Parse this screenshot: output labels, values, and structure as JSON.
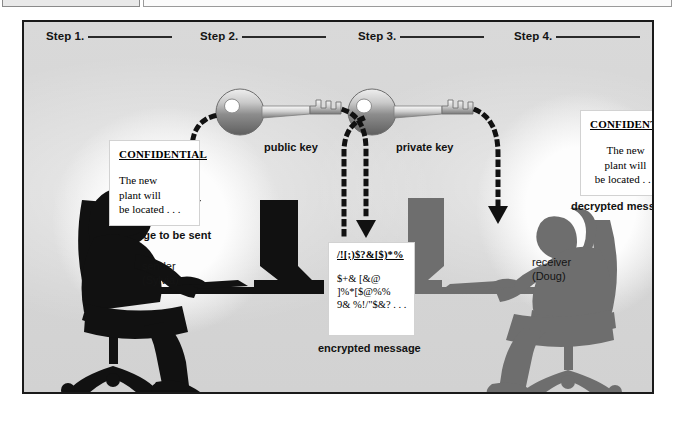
{
  "figure": {
    "background_color": "#d7d7d7",
    "border_color": "#1a1a1a"
  },
  "steps": [
    {
      "label": "Step 1.",
      "answer": ""
    },
    {
      "label": "Step 2.",
      "answer": ""
    },
    {
      "label": "Step 3.",
      "answer": ""
    },
    {
      "label": "Step 4.",
      "answer": ""
    }
  ],
  "messages": {
    "sender_card": {
      "heading": "CONFIDENTIAL",
      "lines": [
        "The new",
        "plant will",
        "be located . . ."
      ],
      "caption": "message to be sent"
    },
    "encrypted_card": {
      "heading": "/![;)$?&[$)*%",
      "lines": [
        "$+& [&@",
        "]%*[$@%%",
        "9& %!/\"$&? . . ."
      ],
      "caption": "encrypted message"
    },
    "receiver_card": {
      "heading": "CONFIDENTIAL",
      "lines": [
        "The new",
        "plant will",
        "be located . . ."
      ],
      "caption": "decrypted message"
    }
  },
  "keys": [
    {
      "name": "public-key",
      "label": "public key"
    },
    {
      "name": "private-key",
      "label": "private key"
    }
  ],
  "people": [
    {
      "name": "sender",
      "role": "sender",
      "person_name": "(Sylvia)"
    },
    {
      "name": "receiver",
      "role": "receiver",
      "person_name": "(Doug)"
    }
  ],
  "colors": {
    "sender_silhouette": "#111111",
    "receiver_silhouette": "#6e6e6e",
    "arrow": "#111111",
    "key_body": "#9a9a9a",
    "paper": "#ffffff"
  }
}
